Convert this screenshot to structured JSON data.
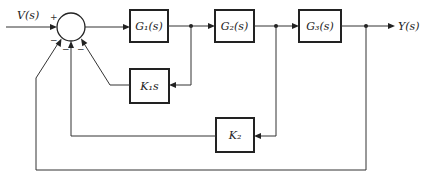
{
  "diagram": {
    "type": "block-diagram",
    "input": {
      "label": "V(s)"
    },
    "output": {
      "label": "Y(s)"
    },
    "summing_junction": {
      "signs": {
        "input": "+",
        "outer_feedback": "−",
        "k2_feedback": "−",
        "k1s_feedback": "−"
      }
    },
    "blocks": [
      {
        "id": "G1",
        "label": "G₁(s)"
      },
      {
        "id": "G2",
        "label": "G₂(s)"
      },
      {
        "id": "G3",
        "label": "G₃(s)"
      },
      {
        "id": "K1s",
        "label": "K₁s"
      },
      {
        "id": "K2",
        "label": "K₂"
      }
    ],
    "connections": [
      {
        "from": "V(s)",
        "to": "sum",
        "sign": "+"
      },
      {
        "from": "sum",
        "to": "G1"
      },
      {
        "from": "G1",
        "to": "G2"
      },
      {
        "from": "G2",
        "to": "G3"
      },
      {
        "from": "G3",
        "to": "Y(s)"
      },
      {
        "from": "G1_output",
        "to": "K1s"
      },
      {
        "from": "K1s",
        "to": "sum",
        "sign": "−"
      },
      {
        "from": "G2_output",
        "to": "K2"
      },
      {
        "from": "K2",
        "to": "sum",
        "sign": "−"
      },
      {
        "from": "Y(s)",
        "to": "sum",
        "sign": "−"
      }
    ]
  }
}
